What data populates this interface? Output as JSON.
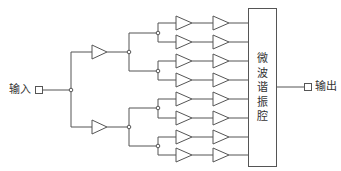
{
  "diagram": {
    "title": "",
    "input_label": "输入",
    "output_label": "输出",
    "resonator_label_chars": [
      "微",
      "波",
      "谐",
      "振",
      "腔"
    ],
    "colors": {
      "line": "#555555",
      "text": "#333333",
      "background": "#ffffff"
    },
    "structure": {
      "stage0_splits": 2,
      "stage1_amplifiers": 2,
      "stage2_splits": 4,
      "parallel_chains": 8,
      "amplifiers_per_chain": 2,
      "combiner": "微波谐振腔"
    }
  }
}
